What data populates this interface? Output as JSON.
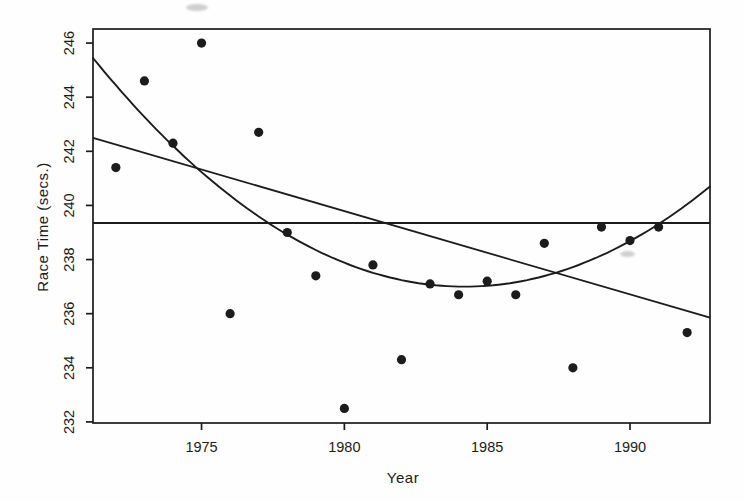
{
  "chart_data": {
    "type": "scatter",
    "title": "",
    "xlabel": "Year",
    "ylabel": "Race Time (secs.)",
    "xlim": [
      1971.2,
      1992.8
    ],
    "ylim": [
      231.96,
      246.52
    ],
    "x_ticks": [
      1975,
      1980,
      1985,
      1990
    ],
    "y_ticks": [
      232,
      234,
      236,
      238,
      240,
      242,
      244,
      246
    ],
    "grid": false,
    "legend": "none",
    "ink_color": "#1c1c1c",
    "point_radius_px": 4.6,
    "series": [
      {
        "name": "race-times",
        "type": "points",
        "x": [
          1972,
          1973,
          1974,
          1975,
          1976,
          1977,
          1978,
          1979,
          1980,
          1981,
          1982,
          1983,
          1984,
          1985,
          1986,
          1987,
          1988,
          1989,
          1990,
          1991,
          1992
        ],
        "y": [
          241.4,
          244.6,
          242.3,
          246.0,
          236.0,
          242.7,
          239.0,
          237.4,
          232.5,
          237.8,
          234.3,
          237.1,
          236.7,
          237.2,
          236.7,
          238.6,
          234.0,
          239.2,
          238.7,
          239.2,
          235.3
        ]
      }
    ],
    "fit_lines": [
      {
        "name": "mean-line",
        "type": "horizontal",
        "y": 239.35
      },
      {
        "name": "linear-fit",
        "type": "linear",
        "x": [
          1971.2,
          1992.8
        ],
        "y": [
          242.5,
          235.85
        ]
      },
      {
        "name": "quadratic-fit",
        "type": "quadratic",
        "vertex_x": 1984.2,
        "vertex_y": 237.0,
        "a": 0.05,
        "x_range": [
          1971.2,
          1992.8
        ]
      }
    ]
  }
}
